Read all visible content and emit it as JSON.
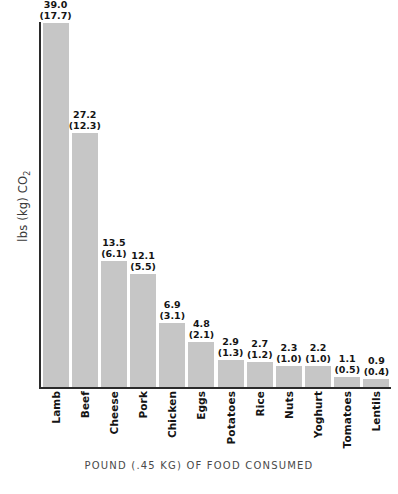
{
  "chart_data": {
    "type": "bar",
    "title": "",
    "xlabel": "POUND (.45 KG) OF FOOD CONSUMED",
    "ylabel": "lbs (kg) CO2",
    "ylabel_main": "lbs (kg) CO",
    "ylabel_subscript": "2",
    "ylim": [
      0,
      39.0
    ],
    "grid": false,
    "legend": "none",
    "categories": [
      "Lamb",
      "Beef",
      "Cheese",
      "Pork",
      "Chicken",
      "Eggs",
      "Potatoes",
      "Rice",
      "Nuts",
      "Yoghurt",
      "Tomatoes",
      "Lentils"
    ],
    "values": [
      39.0,
      27.2,
      13.5,
      12.1,
      6.9,
      4.8,
      2.9,
      2.7,
      2.3,
      2.2,
      1.1,
      0.9
    ],
    "values_kg": [
      17.7,
      12.3,
      6.1,
      5.5,
      3.1,
      2.1,
      1.3,
      1.2,
      1.0,
      1.0,
      0.5,
      0.4
    ],
    "bars": [
      {
        "category": "Lamb",
        "lbs": 39.0,
        "kg": 17.7,
        "label_lbs": "39.0",
        "label_kg": "(17.7)"
      },
      {
        "category": "Beef",
        "lbs": 27.2,
        "kg": 12.3,
        "label_lbs": "27.2",
        "label_kg": "(12.3)"
      },
      {
        "category": "Cheese",
        "lbs": 13.5,
        "kg": 6.1,
        "label_lbs": "13.5",
        "label_kg": "(6.1)"
      },
      {
        "category": "Pork",
        "lbs": 12.1,
        "kg": 5.5,
        "label_lbs": "12.1",
        "label_kg": "(5.5)"
      },
      {
        "category": "Chicken",
        "lbs": 6.9,
        "kg": 3.1,
        "label_lbs": "6.9",
        "label_kg": "(3.1)"
      },
      {
        "category": "Eggs",
        "lbs": 4.8,
        "kg": 2.1,
        "label_lbs": "4.8",
        "label_kg": "(2.1)"
      },
      {
        "category": "Potatoes",
        "lbs": 2.9,
        "kg": 1.3,
        "label_lbs": "2.9",
        "label_kg": "(1.3)"
      },
      {
        "category": "Rice",
        "lbs": 2.7,
        "kg": 1.2,
        "label_lbs": "2.7",
        "label_kg": "(1.2)"
      },
      {
        "category": "Nuts",
        "lbs": 2.3,
        "kg": 1.0,
        "label_lbs": "2.3",
        "label_kg": "(1.0)"
      },
      {
        "category": "Yoghurt",
        "lbs": 2.2,
        "kg": 1.0,
        "label_lbs": "2.2",
        "label_kg": "(1.0)"
      },
      {
        "category": "Tomatoes",
        "lbs": 1.1,
        "kg": 0.5,
        "label_lbs": "1.1",
        "label_kg": "(0.5)"
      },
      {
        "category": "Lentils",
        "lbs": 0.9,
        "kg": 0.4,
        "label_lbs": "0.9",
        "label_kg": "(0.4)"
      }
    ],
    "colors": {
      "bar_fill": "#c6c6c6",
      "axis": "#2b2b2b",
      "value_text": "#141414",
      "axis_title_text": "#4a4a4a",
      "background": "#ffffff"
    }
  }
}
